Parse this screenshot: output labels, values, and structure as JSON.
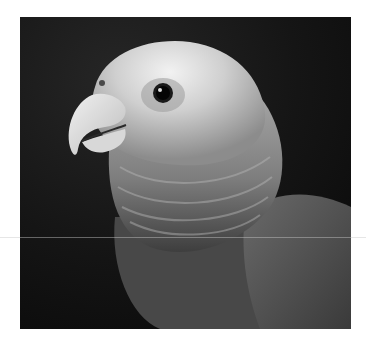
{
  "image": {
    "subject": "Parrot portrait",
    "description": "Black-and-white close-up photograph of a parrot's head and shoulders facing left against a dark background",
    "colors": {
      "page_background": "#ffffff",
      "photo_background": "#121212",
      "head_light": "#e6e6e6",
      "neck_mid": "#8a8a8a",
      "body_dark": "#4a4a4a",
      "eye": "#0a0a0a"
    }
  }
}
